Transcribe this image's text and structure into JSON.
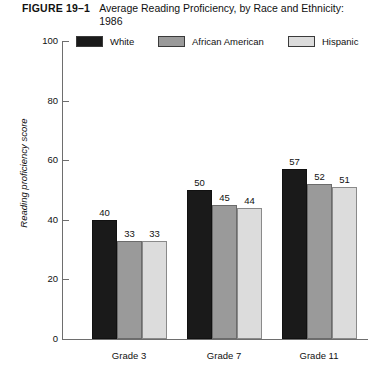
{
  "figure": {
    "number": "FIGURE 19–1",
    "title": "Average Reading Proficiency, by Race and Ethnicity: 1986"
  },
  "colors": {
    "white_series": "#1a1a1a",
    "african_american_series": "#9a9a9a",
    "hispanic_series": "#dcdcdc",
    "axis": "#6e6e6e",
    "text": "#111111",
    "background": "#ffffff"
  },
  "chart_data": {
    "type": "bar",
    "title": "Average Reading Proficiency, by Race and Ethnicity: 1986",
    "xlabel": "",
    "ylabel": "Reading proficiency score",
    "ylim": [
      0,
      100
    ],
    "yticks": [
      0,
      20,
      40,
      60,
      80,
      100
    ],
    "ytick_labels": [
      "0",
      "20",
      "40",
      "60",
      "80",
      "100"
    ],
    "grid": false,
    "legend_position": "top",
    "categories": [
      "Grade 3",
      "Grade 7",
      "Grade 11"
    ],
    "series": [
      {
        "name": "White",
        "values": [
          40,
          50,
          57
        ],
        "swatch": "sw-white"
      },
      {
        "name": "African American",
        "values": [
          33,
          45,
          52
        ],
        "swatch": "sw-aa"
      },
      {
        "name": "Hispanic",
        "values": [
          33,
          44,
          51
        ],
        "swatch": "sw-hisp"
      }
    ],
    "data_labels": [
      [
        "40",
        "33",
        "33"
      ],
      [
        "50",
        "45",
        "44"
      ],
      [
        "57",
        "52",
        "51"
      ]
    ]
  }
}
